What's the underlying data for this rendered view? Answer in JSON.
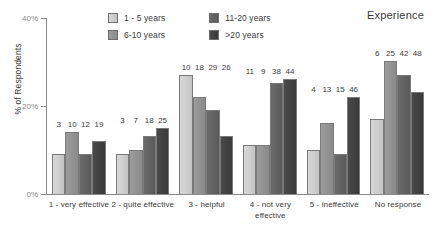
{
  "legend": {
    "title": "Experience",
    "items": [
      {
        "label": "1 - 5 years",
        "color": "#d2d2d2"
      },
      {
        "label": "6-10 years",
        "color": "#949494"
      },
      {
        "label": "11-20 years",
        "color": "#636363"
      },
      {
        "label": ">20 years",
        "color": "#424242"
      }
    ]
  },
  "axis": {
    "ylabel": "% of Respondents",
    "yticks": [
      "0%",
      "20%",
      "40%"
    ]
  },
  "chart_data": {
    "type": "bar",
    "title": "",
    "xlabel": "",
    "ylabel": "% of Respondents",
    "ylim": [
      0,
      40
    ],
    "yticks": [
      0,
      20,
      40
    ],
    "grid": false,
    "legend_position": "top-center",
    "legend_title": "Experience",
    "categories": [
      "1 - very effective",
      "2 - quite effective",
      "3 - helpful",
      "4 - not very effective",
      "5 - ineffective",
      "No response"
    ],
    "series": [
      {
        "name": "1 - 5 years",
        "values": [
          9,
          9,
          27,
          11,
          10,
          17
        ],
        "counts": [
          3,
          3,
          10,
          11,
          4,
          6
        ]
      },
      {
        "name": "6-10 years",
        "values": [
          14,
          10,
          22,
          11,
          16,
          30
        ],
        "counts": [
          10,
          7,
          18,
          9,
          13,
          25
        ]
      },
      {
        "name": "11-20 years",
        "values": [
          9,
          13,
          19,
          25,
          9,
          27
        ],
        "counts": [
          12,
          18,
          29,
          38,
          15,
          42
        ]
      },
      {
        "name": ">20 years",
        "values": [
          12,
          15,
          13,
          26,
          22,
          23
        ],
        "counts": [
          19,
          25,
          26,
          44,
          46,
          48
        ]
      }
    ],
    "data_labels_shown": "counts"
  }
}
